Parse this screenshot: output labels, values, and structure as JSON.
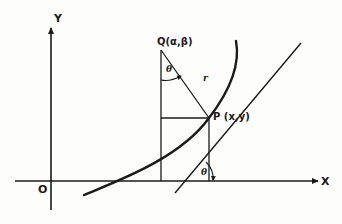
{
  "diagram": {
    "type": "geometry-figure",
    "colors": {
      "ink": "#1a1a1a",
      "background": "#fdfdfb"
    },
    "axes": {
      "x_label": "X",
      "y_label": "Y",
      "origin_label": "O"
    },
    "points": {
      "Q": {
        "label": "Q(α,β)"
      },
      "P": {
        "label": "P (x,y)"
      }
    },
    "segments": {
      "radius_label": "r"
    },
    "angles": {
      "at_Q": "θ",
      "at_x_axis": "θ"
    }
  }
}
